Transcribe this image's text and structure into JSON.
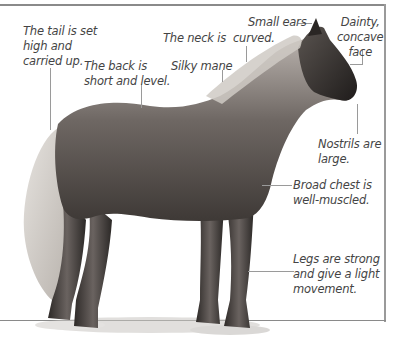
{
  "figure": {
    "frame_color": "#8a8a8a",
    "label_color": "#444444"
  },
  "labels": {
    "tail": "The tail is set\nhigh and\ncarried up.",
    "back": "The back is\nshort and level.",
    "neck": "The neck is  curved.",
    "mane": "Silky mane",
    "ears": "Small ears",
    "face": "Dainty,\nconcave\nface",
    "nostrils": "Nostrils are\nlarge.",
    "chest": "Broad chest is\nwell-muscled.",
    "legs": "Legs are strong\nand give a light\nmovement."
  }
}
